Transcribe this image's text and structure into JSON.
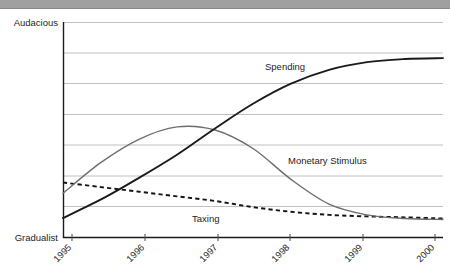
{
  "page": {
    "background_color": "#ffffff",
    "top_bar_color": "#a0a0a0"
  },
  "chart_data": {
    "type": "line",
    "title": "",
    "subtitle": "",
    "xlabel": "",
    "ylabel": "",
    "grid": true,
    "legend_position": "inline-labels",
    "x": [
      1995,
      1996,
      1997,
      1998,
      1999,
      2000
    ],
    "xtick_labels": [
      "1995",
      "1996",
      "1997",
      "1998",
      "1999",
      "2000"
    ],
    "xlim": [
      1995,
      2000
    ],
    "ylim": [
      0,
      7
    ],
    "ytick_labels": [
      "Gradualist",
      "Audacious"
    ],
    "y_axis_low_label": "Gradualist",
    "y_axis_high_label": "Audacious",
    "gridline_count": 7,
    "series": [
      {
        "name": "Spending",
        "style": "solid",
        "color": "#1a1a1a",
        "label_text": "Spending",
        "x": [
          1995,
          1995.5,
          1996,
          1996.5,
          1997,
          1997.5,
          1998,
          1998.5,
          1999,
          1999.5,
          2000
        ],
        "values": [
          0.65,
          1.25,
          1.95,
          2.7,
          3.55,
          4.35,
          5.0,
          5.45,
          5.7,
          5.8,
          5.83
        ]
      },
      {
        "name": "Monetary Stimulus",
        "style": "solid",
        "color": "#6e6e6e",
        "label_text": "Monetary Stimulus",
        "x": [
          1995,
          1995.5,
          1996,
          1996.5,
          1997,
          1997.5,
          1998,
          1998.5,
          1999,
          1999.5,
          2000
        ],
        "values": [
          1.45,
          2.45,
          3.2,
          3.6,
          3.5,
          2.9,
          1.9,
          1.1,
          0.75,
          0.63,
          0.6
        ]
      },
      {
        "name": "Taxing",
        "style": "dashed",
        "color": "#141414",
        "label_text": "Taxing",
        "x": [
          1995,
          1995.5,
          1996,
          1996.5,
          1997,
          1997.5,
          1998,
          1998.5,
          1999,
          1999.5,
          2000
        ],
        "values": [
          1.8,
          1.65,
          1.5,
          1.35,
          1.2,
          1.0,
          0.85,
          0.75,
          0.7,
          0.67,
          0.63
        ]
      }
    ],
    "annotations": [
      {
        "text": "Spending",
        "x": 1997.0,
        "y": 4.9
      },
      {
        "text": "Monetary Stimulus",
        "x": 1998.1,
        "y": 2.45
      },
      {
        "text": "Taxing",
        "x": 1996.65,
        "y": 0.55
      }
    ]
  }
}
